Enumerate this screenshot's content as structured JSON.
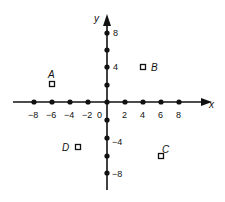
{
  "diagram": {
    "type": "coordinate-plane",
    "axes": {
      "x_label": "x",
      "y_label": "y",
      "origin_label": "0",
      "x_ticks": [
        {
          "value": -8,
          "label": "−8"
        },
        {
          "value": -6,
          "label": "−6"
        },
        {
          "value": -4,
          "label": "−4"
        },
        {
          "value": -2,
          "label": "−2"
        },
        {
          "value": 2,
          "label": "2"
        },
        {
          "value": 4,
          "label": "4"
        },
        {
          "value": 6,
          "label": "6"
        },
        {
          "value": 8,
          "label": "8"
        }
      ],
      "y_ticks": [
        {
          "value": 8,
          "label": "8"
        },
        {
          "value": 4,
          "label": "4"
        },
        {
          "value": -4,
          "label": "−4"
        },
        {
          "value": -8,
          "label": "−8"
        }
      ],
      "x_dots": [
        -8,
        -6,
        -4,
        -2,
        0,
        2,
        4,
        6,
        8
      ],
      "y_dots": [
        8,
        6,
        4,
        2,
        0,
        -2,
        -4,
        -6,
        -8
      ]
    },
    "points": [
      {
        "name": "A",
        "x": -6,
        "y": 2
      },
      {
        "name": "B",
        "x": 4,
        "y": 4
      },
      {
        "name": "C",
        "x": 6,
        "y": -6
      },
      {
        "name": "D",
        "x": -3,
        "y": -5
      }
    ],
    "colors": {
      "ink": "#111111",
      "background": "#ffffff"
    }
  }
}
